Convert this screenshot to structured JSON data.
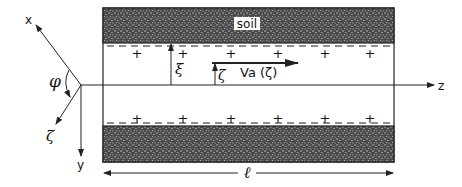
{
  "diagram": {
    "labels": {
      "soil": "soil",
      "x_axis": "x",
      "y_axis": "y",
      "z_axis": "z",
      "zeta_axis": "ζ",
      "phi": "φ",
      "xi": "ξ",
      "zeta": "ζ",
      "velocity": "Va (ζ)",
      "length": "ℓ"
    },
    "charges": {
      "wall": "−",
      "fluid": "+"
    },
    "colors": {
      "line": "#222222",
      "soil_fill": "#5a5a5a",
      "background": "#ffffff"
    }
  }
}
